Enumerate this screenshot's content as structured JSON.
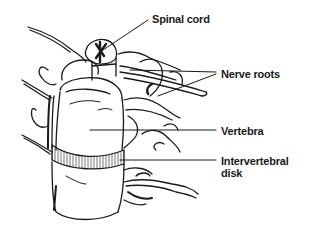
{
  "diagram": {
    "labels": [
      {
        "id": "spinal_cord",
        "text": "Spinal cord"
      },
      {
        "id": "nerve_roots",
        "text": "Nerve roots"
      },
      {
        "id": "vertebra",
        "text": "Vertebra"
      },
      {
        "id": "intervertebral_disk",
        "text": "Intervertebral\ndisk"
      }
    ],
    "label_text": {
      "spinal_cord": "Spinal cord",
      "nerve_roots": "Nerve roots",
      "vertebra": "Vertebra",
      "intervertebral_disk_line1": "Intervertebral",
      "intervertebral_disk_line2": "disk"
    },
    "colors": {
      "line": "#1a1a1a",
      "background": "#ffffff",
      "disk_hatch": "#555555"
    }
  }
}
